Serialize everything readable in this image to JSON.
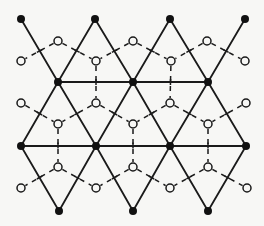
{
  "diagram": {
    "title": "",
    "colors": {
      "background": "#f7f7f5",
      "line": "#1a1a1a",
      "filled_node": "#111111"
    },
    "filled_nodes": [
      {
        "x": 21,
        "y": 19
      },
      {
        "x": 95,
        "y": 19
      },
      {
        "x": 170,
        "y": 19
      },
      {
        "x": 245,
        "y": 19
      },
      {
        "x": 58,
        "y": 82
      },
      {
        "x": 133,
        "y": 82
      },
      {
        "x": 208,
        "y": 82
      },
      {
        "x": 21,
        "y": 146
      },
      {
        "x": 96,
        "y": 146
      },
      {
        "x": 170,
        "y": 146
      },
      {
        "x": 246,
        "y": 146
      },
      {
        "x": 59,
        "y": 211
      },
      {
        "x": 133,
        "y": 211
      },
      {
        "x": 208,
        "y": 211
      }
    ],
    "solid_edges": [
      [
        21,
        19,
        58,
        82
      ],
      [
        95,
        19,
        58,
        82
      ],
      [
        95,
        19,
        133,
        82
      ],
      [
        170,
        19,
        133,
        82
      ],
      [
        170,
        19,
        208,
        82
      ],
      [
        245,
        19,
        208,
        82
      ],
      [
        58,
        82,
        133,
        82
      ],
      [
        133,
        82,
        208,
        82
      ],
      [
        58,
        82,
        21,
        146
      ],
      [
        58,
        82,
        96,
        146
      ],
      [
        133,
        82,
        96,
        146
      ],
      [
        133,
        82,
        170,
        146
      ],
      [
        208,
        82,
        170,
        146
      ],
      [
        208,
        82,
        246,
        146
      ],
      [
        21,
        146,
        96,
        146
      ],
      [
        96,
        146,
        170,
        146
      ],
      [
        170,
        146,
        246,
        146
      ],
      [
        21,
        146,
        59,
        211
      ],
      [
        96,
        146,
        59,
        211
      ],
      [
        96,
        146,
        133,
        211
      ],
      [
        170,
        146,
        133,
        211
      ],
      [
        170,
        146,
        208,
        211
      ],
      [
        246,
        146,
        208,
        211
      ]
    ],
    "open_nodes": [
      {
        "x": 58,
        "y": 41
      },
      {
        "x": 133,
        "y": 41
      },
      {
        "x": 207,
        "y": 41
      },
      {
        "x": 21,
        "y": 61
      },
      {
        "x": 96,
        "y": 61
      },
      {
        "x": 171,
        "y": 61
      },
      {
        "x": 245,
        "y": 61
      },
      {
        "x": 21,
        "y": 103
      },
      {
        "x": 96,
        "y": 103
      },
      {
        "x": 170,
        "y": 103
      },
      {
        "x": 246,
        "y": 103
      },
      {
        "x": 58,
        "y": 124
      },
      {
        "x": 133,
        "y": 124
      },
      {
        "x": 208,
        "y": 124
      },
      {
        "x": 58,
        "y": 167
      },
      {
        "x": 133,
        "y": 167
      },
      {
        "x": 208,
        "y": 167
      },
      {
        "x": 21,
        "y": 188
      },
      {
        "x": 96,
        "y": 188
      },
      {
        "x": 170,
        "y": 188
      },
      {
        "x": 247,
        "y": 188
      }
    ],
    "dashed_edges": [
      [
        58,
        41,
        21,
        61
      ],
      [
        58,
        41,
        96,
        61
      ],
      [
        133,
        41,
        96,
        61
      ],
      [
        133,
        41,
        171,
        61
      ],
      [
        207,
        41,
        171,
        61
      ],
      [
        207,
        41,
        245,
        61
      ],
      [
        96,
        61,
        96,
        103
      ],
      [
        171,
        61,
        170,
        103
      ],
      [
        21,
        103,
        58,
        124
      ],
      [
        96,
        103,
        58,
        124
      ],
      [
        96,
        103,
        133,
        124
      ],
      [
        170,
        103,
        133,
        124
      ],
      [
        170,
        103,
        208,
        124
      ],
      [
        246,
        103,
        208,
        124
      ],
      [
        58,
        124,
        58,
        167
      ],
      [
        133,
        124,
        133,
        167
      ],
      [
        208,
        124,
        208,
        167
      ],
      [
        58,
        167,
        21,
        188
      ],
      [
        58,
        167,
        96,
        188
      ],
      [
        133,
        167,
        96,
        188
      ],
      [
        133,
        167,
        170,
        188
      ],
      [
        208,
        167,
        170,
        188
      ],
      [
        208,
        167,
        247,
        188
      ]
    ]
  }
}
